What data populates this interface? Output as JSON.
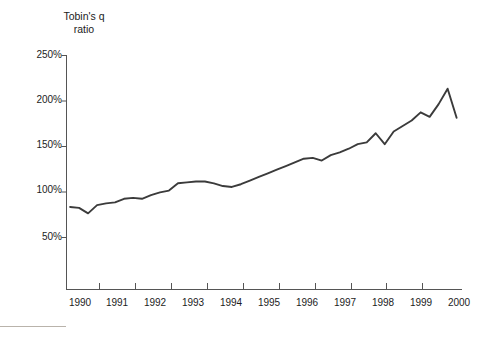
{
  "chart_data": {
    "type": "line",
    "title": "Tobin's q\nratio",
    "xlabel": "",
    "ylabel": "Tobin's q ratio",
    "ylim": [
      0,
      250
    ],
    "xlim": [
      1989.6,
      2000.6
    ],
    "grid": false,
    "legend": null,
    "ytick_labels": [
      "250%",
      "200%",
      "150%",
      "100%",
      "50%"
    ],
    "ytick_values": [
      250,
      200,
      150,
      100,
      50
    ],
    "xtick_labels": [
      "1990",
      "1991",
      "1992",
      "1993",
      "1994",
      "1995",
      "1996",
      "1997",
      "1998",
      "1999",
      "2000"
    ],
    "xtick_values": [
      1990,
      1991,
      1992,
      1993,
      1994,
      1995,
      1996,
      1997,
      1998,
      1999,
      2000
    ],
    "line_color": "#3b3b3b",
    "series": [
      {
        "name": "Tobin's q ratio",
        "x": [
          1989.7,
          1989.95,
          1990.2,
          1990.45,
          1990.7,
          1990.95,
          1991.2,
          1991.45,
          1991.7,
          1991.95,
          1992.2,
          1992.45,
          1992.7,
          1992.95,
          1993.2,
          1993.45,
          1993.7,
          1993.95,
          1994.2,
          1994.45,
          1994.7,
          1994.95,
          1995.2,
          1995.45,
          1995.7,
          1995.95,
          1996.2,
          1996.45,
          1996.7,
          1996.95,
          1997.2,
          1997.45,
          1997.7,
          1997.95,
          1998.2,
          1998.45,
          1998.7,
          1998.95,
          1999.2,
          1999.45,
          1999.7,
          1999.95,
          2000.2,
          2000.45
        ],
        "values": [
          83,
          82,
          76,
          85,
          87,
          88,
          92,
          93,
          92,
          96,
          99,
          101,
          109,
          110,
          111,
          111,
          109,
          106,
          105,
          108,
          112,
          116,
          120,
          124,
          128,
          132,
          136,
          137,
          134,
          140,
          143,
          147,
          152,
          154,
          164,
          152,
          166,
          172,
          178,
          187,
          182,
          196,
          213,
          181
        ]
      }
    ]
  },
  "axis": {
    "y_axis_name": "y-axis",
    "x_axis_name": "x-axis"
  }
}
